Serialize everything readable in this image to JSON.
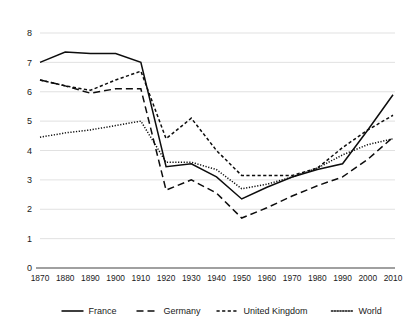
{
  "chart_data": {
    "type": "line",
    "title": "",
    "subtitle": "",
    "xlabel": "",
    "ylabel": "",
    "grid": true,
    "legend_position": "bottom",
    "xlim": [
      1870,
      2010
    ],
    "ylim": [
      0,
      8
    ],
    "y_ticks": [
      0,
      1,
      2,
      3,
      4,
      5,
      6,
      7,
      8
    ],
    "x": [
      1870,
      1880,
      1890,
      1900,
      1910,
      1920,
      1930,
      1940,
      1950,
      1960,
      1970,
      1980,
      1990,
      2000,
      2010
    ],
    "categories": [
      "1870",
      "1880",
      "1890",
      "1900",
      "1910",
      "1920",
      "1930",
      "1940",
      "1950",
      "1960",
      "1970",
      "1980",
      "1990",
      "2000",
      "2010"
    ],
    "series": [
      {
        "name": "France",
        "style": "solid",
        "values": [
          7.0,
          7.35,
          7.3,
          7.3,
          7.0,
          3.45,
          3.55,
          3.1,
          2.35,
          2.75,
          3.1,
          3.35,
          3.55,
          4.7,
          5.9
        ]
      },
      {
        "name": "Germany",
        "style": "dashed",
        "values": [
          6.4,
          6.2,
          5.95,
          6.1,
          6.1,
          2.65,
          3.0,
          2.55,
          1.7,
          2.05,
          2.45,
          2.8,
          3.1,
          3.7,
          4.45
        ]
      },
      {
        "name": "United Kingdom",
        "style": "short-dashed",
        "values": [
          6.4,
          6.2,
          6.05,
          6.4,
          6.7,
          4.4,
          5.1,
          4.0,
          3.15,
          3.15,
          3.15,
          3.4,
          4.1,
          4.7,
          5.2
        ]
      },
      {
        "name": "World",
        "style": "dotted",
        "values": [
          4.45,
          4.6,
          4.7,
          4.85,
          5.0,
          3.6,
          3.6,
          3.35,
          2.7,
          2.85,
          3.1,
          3.4,
          3.85,
          4.2,
          4.4
        ]
      }
    ]
  },
  "legend": {
    "items": [
      {
        "label": "France",
        "style": "solid"
      },
      {
        "label": "Germany",
        "style": "dashed"
      },
      {
        "label": "United Kingdom",
        "style": "short-dashed"
      },
      {
        "label": "World",
        "style": "dotted"
      }
    ]
  }
}
